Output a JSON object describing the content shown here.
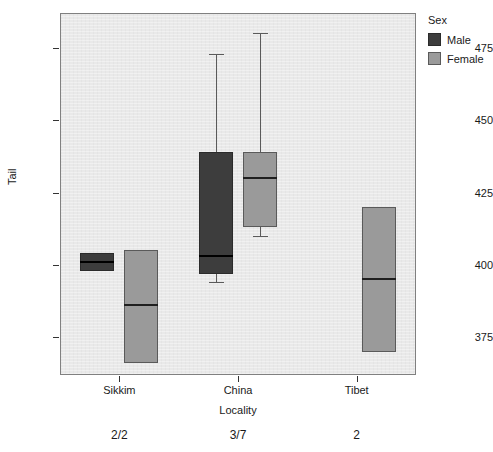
{
  "chart_data": {
    "type": "box",
    "title": "",
    "xlabel": "Locality",
    "ylabel": "Tail",
    "ylim": [
      362,
      487
    ],
    "yticks": [
      375,
      400,
      425,
      450,
      475
    ],
    "ytick_labels": [
      "375",
      "400",
      "425",
      "450",
      "475"
    ],
    "categories": [
      "Sikkim",
      "China",
      "Tibet"
    ],
    "sample_sizes": [
      "2/2",
      "3/7",
      "2"
    ],
    "grid": false,
    "legend": {
      "title": "Sex",
      "position": "right",
      "entries": [
        {
          "label": "Male",
          "color": "#3d3d3d"
        },
        {
          "label": "Female",
          "color": "#9a9a9a"
        }
      ]
    },
    "series": [
      {
        "name": "Male",
        "color": "#3d3d3d",
        "boxes": [
          {
            "category": "Sikkim",
            "lower_whisker": 398,
            "q1": 398,
            "median": 401,
            "q3": 404,
            "upper_whisker": 404
          },
          {
            "category": "China",
            "lower_whisker": 394,
            "q1": 397,
            "median": 403,
            "q3": 439,
            "upper_whisker": 473
          }
        ]
      },
      {
        "name": "Female",
        "color": "#9a9a9a",
        "boxes": [
          {
            "category": "Sikkim",
            "lower_whisker": 366,
            "q1": 366,
            "median": 386,
            "q3": 405,
            "upper_whisker": 405
          },
          {
            "category": "China",
            "lower_whisker": 410,
            "q1": 413,
            "median": 430,
            "q3": 439,
            "upper_whisker": 480
          },
          {
            "category": "Tibet",
            "lower_whisker": 370,
            "q1": 370,
            "median": 395,
            "q3": 420,
            "upper_whisker": 420
          }
        ]
      }
    ]
  }
}
